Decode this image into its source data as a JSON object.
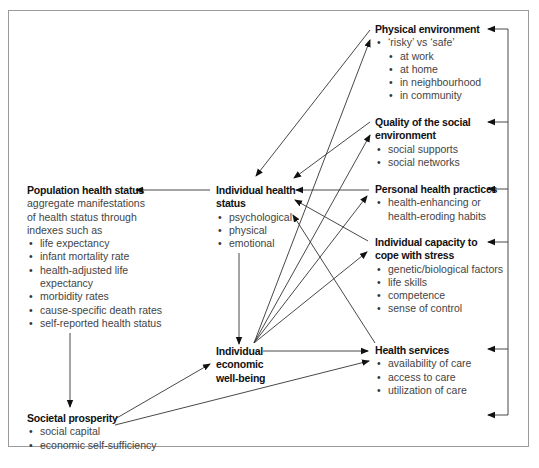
{
  "diagram": {
    "nodes": {
      "physical_environment": {
        "title": "Physical environment",
        "items": [
          {
            "text": "‘risky’ vs ‘safe’",
            "level": 0
          },
          {
            "text": "at work",
            "level": 1
          },
          {
            "text": "at home",
            "level": 1
          },
          {
            "text": "in neighbourhood",
            "level": 1
          },
          {
            "text": "in community",
            "level": 1
          }
        ]
      },
      "social_environment": {
        "title_line1": "Quality of the social",
        "title_line2": "environment",
        "items": [
          "social supports",
          "social networks"
        ]
      },
      "personal_health_practices": {
        "title": "Personal health practices",
        "items": [
          "health-enhancing or",
          "health-eroding habits"
        ]
      },
      "capacity_to_cope": {
        "title_line1": "Individual capacity to",
        "title_line2": "cope with stress",
        "items": [
          "genetic/biological factors",
          "life skills",
          "competence",
          "sense of control"
        ]
      },
      "health_services": {
        "title": "Health services",
        "items": [
          "availability of care",
          "access to care",
          "utilization of care"
        ]
      },
      "population_health_status": {
        "title": "Population health status",
        "desc_lines": [
          "aggregate manifestations",
          "of health status through",
          "indexes such as"
        ],
        "items": [
          "life expectancy",
          "infant mortality rate",
          "health-adjusted life",
          "expectancy",
          "morbidity rates",
          "cause-specific death rates",
          "self-reported health status"
        ]
      },
      "individual_health_status": {
        "title_line1": "Individual health",
        "title_line2": "status",
        "items": [
          "psychological",
          "physical",
          "emotional"
        ]
      },
      "individual_economic_wellbeing": {
        "title_line1": "Individual",
        "title_line2": "economic",
        "title_line3": "well-being"
      },
      "societal_prosperity": {
        "title": "Societal prosperity",
        "items": [
          "social capital",
          "economic self-sufficiency"
        ]
      }
    },
    "edges": [
      {
        "from": "Physical environment",
        "to": "Individual health status"
      },
      {
        "from": "Quality of the social environment",
        "to": "Individual health status"
      },
      {
        "from": "Personal health practices",
        "to": "Individual health status"
      },
      {
        "from": "Individual capacity to cope with stress",
        "to": "Individual health status"
      },
      {
        "from": "Health services",
        "to": "Individual health status"
      },
      {
        "from": "Individual health status",
        "to": "Population health status"
      },
      {
        "from": "Individual health status",
        "to": "Individual economic well-being"
      },
      {
        "from": "Population health status",
        "to": "Societal prosperity"
      },
      {
        "from": "Societal prosperity",
        "to": "Individual economic well-being"
      },
      {
        "from": "Societal prosperity",
        "to": "Health services"
      },
      {
        "from": "Individual economic well-being",
        "to": "Physical environment"
      },
      {
        "from": "Individual economic well-being",
        "to": "Quality of the social environment"
      },
      {
        "from": "Individual economic well-being",
        "to": "Personal health practices"
      },
      {
        "from": "Individual economic well-being",
        "to": "Individual capacity to cope with stress"
      },
      {
        "from": "Individual economic well-being",
        "to": "Health services"
      },
      {
        "from": "Right-side feedback bracket",
        "to": "all right-column determinants"
      }
    ]
  }
}
